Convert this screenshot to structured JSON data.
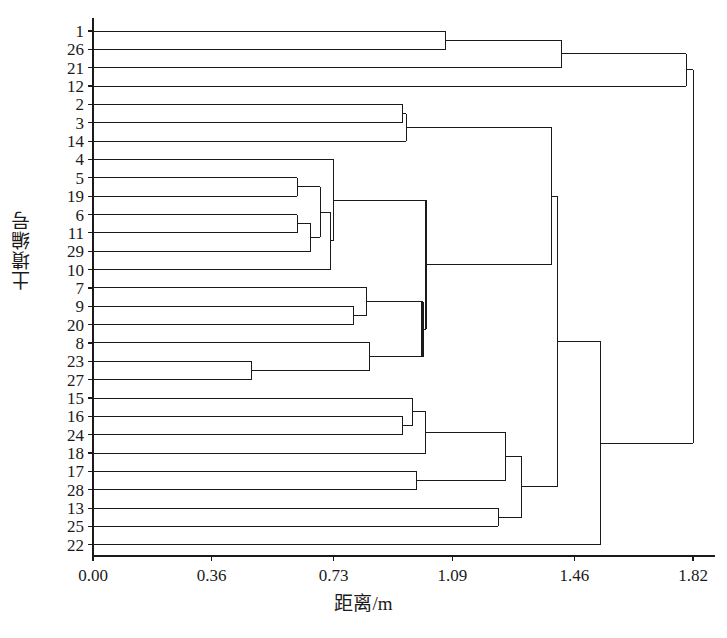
{
  "chart_data": {
    "type": "dendrogram",
    "title": "",
    "subtitle": "",
    "xlabel": "距离/m",
    "ylabel": "土墤编号",
    "grid": false,
    "legend_position": "none",
    "xlim": [
      0.0,
      1.82
    ],
    "x_ticks": [
      "0.00",
      "0.36",
      "0.73",
      "1.09",
      "1.46",
      "1.82"
    ],
    "x_tick_values": [
      0.0,
      0.36,
      0.73,
      1.09,
      1.46,
      1.82
    ],
    "leaf_labels": [
      "1",
      "26",
      "21",
      "12",
      "2",
      "3",
      "14",
      "4",
      "5",
      "19",
      "6",
      "11",
      "29",
      "10",
      "7",
      "9",
      "20",
      "8",
      "23",
      "27",
      "15",
      "16",
      "24",
      "18",
      "17",
      "28",
      "13",
      "25",
      "22"
    ],
    "leaf_count": 29,
    "line_color": "#1a1a1a",
    "axis_color": "#1a1a1a",
    "background_color": "#ffffff",
    "merges": [
      {
        "id": "m1",
        "left": "1",
        "right": "26",
        "distance": 1.07
      },
      {
        "id": "m2",
        "left": "m1",
        "right": "21",
        "distance": 1.42
      },
      {
        "id": "m3",
        "left": "m2",
        "right": "12",
        "distance": 1.8
      },
      {
        "id": "m4",
        "left": "2",
        "right": "3",
        "distance": 0.94
      },
      {
        "id": "m5",
        "left": "m4",
        "right": "14",
        "distance": 0.95
      },
      {
        "id": "m6",
        "left": "5",
        "right": "19",
        "distance": 0.62
      },
      {
        "id": "m7",
        "left": "6",
        "right": "11",
        "distance": 0.62
      },
      {
        "id": "m8",
        "left": "m7",
        "right": "29",
        "distance": 0.66
      },
      {
        "id": "m9",
        "left": "m6",
        "right": "m8",
        "distance": 0.69
      },
      {
        "id": "m10",
        "left": "m9",
        "right": "10",
        "distance": 0.72
      },
      {
        "id": "m11",
        "left": "4",
        "right": "m10",
        "distance": 0.73
      },
      {
        "id": "m12",
        "left": "9",
        "right": "20",
        "distance": 0.79
      },
      {
        "id": "m13",
        "left": "7",
        "right": "m12",
        "distance": 0.83
      },
      {
        "id": "m14",
        "left": "23",
        "right": "27",
        "distance": 0.48
      },
      {
        "id": "m15",
        "left": "8",
        "right": "m14",
        "distance": 0.84
      },
      {
        "id": "m16",
        "left": "m13",
        "right": "m15",
        "distance": 1.0
      },
      {
        "id": "m17",
        "left": "m11",
        "right": "m16",
        "distance": 1.01
      },
      {
        "id": "m18",
        "left": "m5",
        "right": "m17",
        "distance": 1.39
      },
      {
        "id": "m19",
        "left": "16",
        "right": "24",
        "distance": 0.94
      },
      {
        "id": "m20",
        "left": "15",
        "right": "m19",
        "distance": 0.97
      },
      {
        "id": "m21",
        "left": "m20",
        "right": "18",
        "distance": 1.01
      },
      {
        "id": "m22",
        "left": "17",
        "right": "28",
        "distance": 0.98
      },
      {
        "id": "m23",
        "left": "m21",
        "right": "m22",
        "distance": 1.25
      },
      {
        "id": "m24",
        "left": "13",
        "right": "25",
        "distance": 1.23
      },
      {
        "id": "m25",
        "left": "m23",
        "right": "m24",
        "distance": 1.3
      },
      {
        "id": "m26",
        "left": "m18",
        "right": "m25",
        "distance": 1.41
      },
      {
        "id": "m27",
        "left": "m26",
        "right": "22",
        "distance": 1.54
      },
      {
        "id": "m28",
        "left": "m3",
        "right": "m27",
        "distance": 1.82
      }
    ]
  },
  "axes": {
    "x_title": "距离/m",
    "y_title": "土墤编号"
  }
}
